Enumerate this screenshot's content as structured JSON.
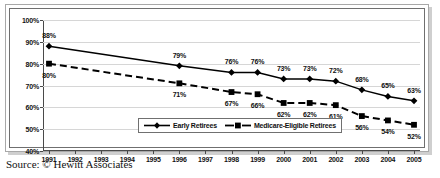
{
  "chart_data": {
    "type": "line",
    "title": "",
    "subtitle": "",
    "xlabel": "",
    "ylabel": "",
    "ylim": [
      40,
      100
    ],
    "ytick_labels": [
      "100%",
      "90%",
      "80%",
      "70%",
      "60%",
      "50%",
      "40%"
    ],
    "ytick_values": [
      100,
      90,
      80,
      70,
      60,
      50,
      40
    ],
    "grid": true,
    "legend_position": "inside-bottom-center",
    "categories": [
      "1991",
      "1992",
      "1993",
      "1994",
      "1995",
      "1996",
      "1997",
      "1998",
      "1999",
      "2000",
      "2001",
      "2002",
      "2003",
      "2004",
      "2005"
    ],
    "series": [
      {
        "name": "Early Retirees",
        "marker": "diamond",
        "linestyle": "solid",
        "color": "#000000",
        "values": [
          88,
          null,
          null,
          null,
          null,
          79,
          null,
          76,
          76,
          73,
          73,
          72,
          68,
          65,
          63
        ],
        "data_labels": [
          "88%",
          "",
          "",
          "",
          "",
          "79%",
          "",
          "76%",
          "76%",
          "73%",
          "73%",
          "72%",
          "68%",
          "65%",
          "63%"
        ]
      },
      {
        "name": "Medicare-Eligible Retirees",
        "marker": "square",
        "linestyle": "dashed",
        "color": "#000000",
        "values": [
          80,
          null,
          null,
          null,
          null,
          71,
          null,
          67,
          66,
          62,
          62,
          61,
          56,
          54,
          52
        ],
        "data_labels": [
          "80%",
          "",
          "",
          "",
          "",
          "71%",
          "",
          "67%",
          "66%",
          "62%",
          "62%",
          "61%",
          "56%",
          "54%",
          "52%"
        ]
      }
    ]
  },
  "legend": {
    "entries": [
      {
        "label": "Early Retirees",
        "marker": "diamond",
        "linestyle": "solid"
      },
      {
        "label": "Medicare-Eligible Retirees",
        "marker": "square",
        "linestyle": "dashed"
      }
    ]
  },
  "footer": {
    "source": "Source: © Hewitt Associates"
  },
  "colors": {
    "series": "#000000",
    "grid": "#d6d6d6",
    "axis": "#4a4a4a",
    "frame": "#6f6f6f",
    "outer_frame": "#a8a8a8",
    "shadow": "#cfcfcf",
    "background": "#ffffff",
    "text": "#111111"
  }
}
